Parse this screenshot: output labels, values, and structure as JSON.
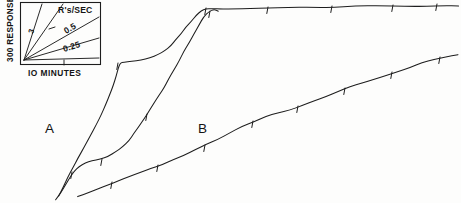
{
  "figure": {
    "type": "cumulative-response-record",
    "width": 461,
    "height": 203,
    "background_color": "#fdfdfc",
    "ink_color": "#1d1d1d"
  },
  "legend": {
    "name": "rate-calibration-box",
    "title": "R's/SEC",
    "y_axis_label": "300 RESPONSES",
    "x_axis_label": "IO MINUTES",
    "slopes": [
      {
        "label": "3",
        "value": 3
      },
      {
        "label": "",
        "value": 1
      },
      {
        "label": "0.5",
        "value": 0.5
      },
      {
        "label": "0.25",
        "value": 0.25
      }
    ]
  },
  "curve_labels": [
    {
      "name": "curve-label-a",
      "text": "A"
    },
    {
      "name": "curve-label-b",
      "text": "B"
    }
  ],
  "chart_data": {
    "type": "line",
    "title": "",
    "xlabel": "IO MINUTES",
    "ylabel": "300 RESPONSES",
    "grid": false,
    "legend_position": "top-left-inset",
    "axis_note": "cumulative record; slope equals response rate in responses per second",
    "rate_calibration": [
      3,
      1,
      0.5,
      0.25
    ],
    "series": [
      {
        "name": "A",
        "label": "A",
        "description": "upper cumulative record: steep acceleration, brief plateau, renewed steep rise, then flat terminal segment",
        "points": [
          [
            59,
            196
          ],
          [
            63,
            188
          ],
          [
            68,
            178
          ],
          [
            73,
            168
          ],
          [
            78,
            158
          ],
          [
            84,
            147
          ],
          [
            90,
            136
          ],
          [
            96,
            125
          ],
          [
            101,
            114
          ],
          [
            106,
            104
          ],
          [
            110,
            94
          ],
          [
            113,
            85
          ],
          [
            116,
            76
          ],
          [
            118,
            68
          ],
          [
            120,
            63
          ],
          [
            124,
            62
          ],
          [
            132,
            61
          ],
          [
            141,
            60
          ],
          [
            150,
            58
          ],
          [
            158,
            55
          ],
          [
            165,
            51
          ],
          [
            171,
            46
          ],
          [
            176,
            40
          ],
          [
            181,
            34
          ],
          [
            186,
            27
          ],
          [
            191,
            21
          ],
          [
            196,
            15
          ],
          [
            201,
            11
          ],
          [
            206,
            9
          ],
          [
            212,
            9
          ],
          [
            222,
            9
          ],
          [
            235,
            8
          ],
          [
            250,
            8
          ],
          [
            268,
            8
          ],
          [
            288,
            7
          ],
          [
            310,
            7
          ],
          [
            332,
            7
          ],
          [
            355,
            6
          ],
          [
            380,
            6
          ],
          [
            405,
            6
          ],
          [
            425,
            6
          ],
          [
            445,
            6
          ],
          [
            459,
            6
          ]
        ],
        "pips": [
          [
            118,
            64
          ],
          [
            206,
            9
          ],
          [
            268,
            8
          ],
          [
            332,
            7
          ],
          [
            393,
            6
          ],
          [
            437,
            5
          ]
        ]
      },
      {
        "name": "A2",
        "label": "",
        "description": "middle cumulative record belonging to session A: slower start then long steady rise joining the upper record",
        "points": [
          [
            56,
            199
          ],
          [
            61,
            192
          ],
          [
            66,
            184
          ],
          [
            70,
            177
          ],
          [
            74,
            171
          ],
          [
            79,
            166
          ],
          [
            85,
            163
          ],
          [
            92,
            161
          ],
          [
            100,
            159
          ],
          [
            108,
            156
          ],
          [
            116,
            152
          ],
          [
            123,
            147
          ],
          [
            129,
            141
          ],
          [
            134,
            134
          ],
          [
            139,
            127
          ],
          [
            144,
            119
          ],
          [
            149,
            111
          ],
          [
            154,
            103
          ],
          [
            159,
            95
          ],
          [
            164,
            87
          ],
          [
            169,
            79
          ],
          [
            174,
            70
          ],
          [
            179,
            61
          ],
          [
            184,
            52
          ],
          [
            189,
            43
          ],
          [
            194,
            34
          ],
          [
            199,
            25
          ],
          [
            204,
            17
          ],
          [
            209,
            12
          ],
          [
            214,
            10
          ],
          [
            218,
            11
          ]
        ],
        "pips": [
          [
            72,
            173
          ],
          [
            102,
            160
          ],
          [
            147,
            115
          ],
          [
            210,
            12
          ]
        ]
      },
      {
        "name": "B",
        "label": "B",
        "description": "lower cumulative record: long uniform moderate rate with regular reinforcement pips",
        "points": [
          [
            78,
            197
          ],
          [
            88,
            193
          ],
          [
            98,
            189
          ],
          [
            108,
            185
          ],
          [
            118,
            181
          ],
          [
            129,
            177
          ],
          [
            140,
            173
          ],
          [
            151,
            169
          ],
          [
            162,
            165
          ],
          [
            173,
            160
          ],
          [
            184,
            155
          ],
          [
            195,
            150
          ],
          [
            206,
            145
          ],
          [
            218,
            139
          ],
          [
            230,
            133
          ],
          [
            242,
            127
          ],
          [
            254,
            122
          ],
          [
            266,
            117
          ],
          [
            278,
            113
          ],
          [
            290,
            110
          ],
          [
            302,
            106
          ],
          [
            314,
            101
          ],
          [
            326,
            96
          ],
          [
            338,
            91
          ],
          [
            350,
            87
          ],
          [
            362,
            83
          ],
          [
            374,
            79
          ],
          [
            386,
            75
          ],
          [
            398,
            71
          ],
          [
            410,
            67
          ],
          [
            422,
            63
          ],
          [
            434,
            60
          ],
          [
            446,
            57
          ],
          [
            458,
            55
          ]
        ],
        "pips": [
          [
            112,
            183
          ],
          [
            158,
            166
          ],
          [
            205,
            146
          ],
          [
            253,
            122
          ],
          [
            298,
            107
          ],
          [
            345,
            89
          ],
          [
            392,
            73
          ],
          [
            440,
            58
          ]
        ]
      }
    ]
  }
}
